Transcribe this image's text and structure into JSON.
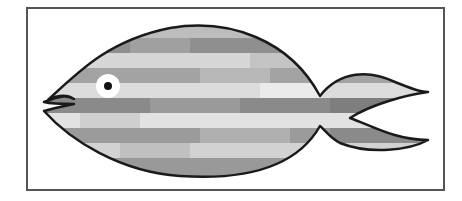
{
  "image": {
    "description": "Clip-art fish with gray horizontal stripes inside a rectangular frame",
    "frame": {
      "x": 27,
      "y": 8,
      "width": 417,
      "height": 182,
      "stroke": "#555555"
    },
    "colors": {
      "background": "#ffffff",
      "outline": "#1a1a1a",
      "eye_white": "#ffffff",
      "pupil": "#111111",
      "stripe_dark": "#8c8c8c",
      "stripe_mid": "#a8a8a8",
      "stripe_light": "#cfcfcf",
      "stripe_lightest": "#e4e4e4"
    },
    "stripes": [
      {
        "y": 25,
        "h": 13,
        "fill": "#bdbdbd"
      },
      {
        "y": 38,
        "h": 15,
        "fill": "#8f8f8f"
      },
      {
        "y": 53,
        "h": 15,
        "fill": "#d6d6d6"
      },
      {
        "y": 68,
        "h": 15,
        "fill": "#a3a3a3"
      },
      {
        "y": 83,
        "h": 15,
        "fill": "#dcdcdc"
      },
      {
        "y": 98,
        "h": 15,
        "fill": "#8a8a8a"
      },
      {
        "y": 113,
        "h": 15,
        "fill": "#e2e2e2"
      },
      {
        "y": 128,
        "h": 15,
        "fill": "#9b9b9b"
      },
      {
        "y": 143,
        "h": 15,
        "fill": "#d2d2d2"
      },
      {
        "y": 158,
        "h": 20,
        "fill": "#999999"
      }
    ],
    "patches": [
      {
        "x": 130,
        "y": 38,
        "w": 60,
        "h": 15,
        "fill": "#a0a0a0"
      },
      {
        "x": 250,
        "y": 53,
        "w": 80,
        "h": 15,
        "fill": "#c4c4c4"
      },
      {
        "x": 200,
        "y": 68,
        "w": 70,
        "h": 15,
        "fill": "#b8b8b8"
      },
      {
        "x": 260,
        "y": 83,
        "w": 60,
        "h": 15,
        "fill": "#ebebeb"
      },
      {
        "x": 150,
        "y": 98,
        "w": 90,
        "h": 15,
        "fill": "#9a9a9a"
      },
      {
        "x": 80,
        "y": 113,
        "w": 60,
        "h": 15,
        "fill": "#cfcfcf"
      },
      {
        "x": 200,
        "y": 128,
        "w": 90,
        "h": 15,
        "fill": "#b0b0b0"
      },
      {
        "x": 120,
        "y": 143,
        "w": 70,
        "h": 15,
        "fill": "#c0c0c0"
      },
      {
        "x": 330,
        "y": 98,
        "w": 90,
        "h": 15,
        "fill": "#7e7e7e"
      },
      {
        "x": 330,
        "y": 128,
        "w": 90,
        "h": 15,
        "fill": "#8a8a8a"
      }
    ],
    "eye": {
      "cx": 108,
      "cy": 86,
      "r_outer": 12,
      "r_pupil": 4
    }
  }
}
